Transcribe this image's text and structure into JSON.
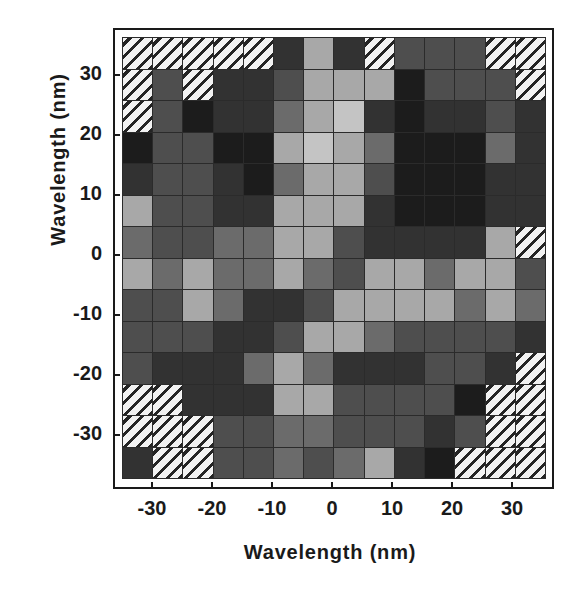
{
  "chart_data": {
    "type": "heatmap",
    "title": "",
    "xlabel": "Wavelength (nm)",
    "ylabel": "Wavelength (nm)",
    "xlim": [
      -35,
      35
    ],
    "ylim": [
      -35,
      35
    ],
    "cell_size_nm": 5,
    "grid": true,
    "legend": "none",
    "n_cols": 14,
    "n_rows": 14,
    "xticks": [
      "-30",
      "-20",
      "-10",
      "0",
      "10",
      "20",
      "30"
    ],
    "yticks": [
      "30",
      "20",
      "10",
      "0",
      "-10",
      "-20",
      "-30"
    ],
    "xtick_values": [
      -30,
      -20,
      -10,
      0,
      10,
      20,
      30
    ],
    "ytick_values": [
      30,
      20,
      10,
      0,
      -10,
      -20,
      -30
    ],
    "x_centers": [
      -32.5,
      -27.5,
      -22.5,
      -17.5,
      -12.5,
      -7.5,
      -2.5,
      2.5,
      7.5,
      12.5,
      17.5,
      22.5,
      27.5,
      32.5
    ],
    "y_centers": [
      32.5,
      27.5,
      22.5,
      17.5,
      12.5,
      7.5,
      2.5,
      -2.5,
      -7.5,
      -12.5,
      -17.5,
      -22.5,
      -27.5,
      -32.5
    ],
    "levels": {
      "hatch": "no data / masked",
      "1": "#1c1c1c",
      "2": "#323232",
      "3": "#4e4e4e",
      "4": "#6b6b6b",
      "5": "#a8a8a8",
      "6": "#c4c4c4"
    },
    "values": [
      [
        "hatch",
        "hatch",
        "hatch",
        "hatch",
        "hatch",
        "2",
        "5",
        "2",
        "hatch",
        "3",
        "3",
        "3",
        "hatch",
        "hatch"
      ],
      [
        "hatch",
        "3",
        "hatch",
        "2",
        "2",
        "3",
        "5",
        "5",
        "5",
        "1",
        "3",
        "3",
        "3",
        "hatch"
      ],
      [
        "hatch",
        "3",
        "1",
        "2",
        "2",
        "4",
        "5",
        "6",
        "2",
        "1",
        "2",
        "2",
        "3",
        "2"
      ],
      [
        "1",
        "3",
        "3",
        "1",
        "1",
        "5",
        "6",
        "5",
        "4",
        "1",
        "1",
        "1",
        "4",
        "2"
      ],
      [
        "2",
        "3",
        "3",
        "2",
        "1",
        "4",
        "5",
        "5",
        "3",
        "1",
        "1",
        "1",
        "2",
        "2"
      ],
      [
        "5",
        "3",
        "3",
        "2",
        "2",
        "5",
        "5",
        "5",
        "2",
        "1",
        "1",
        "1",
        "2",
        "2"
      ],
      [
        "4",
        "3",
        "3",
        "4",
        "4",
        "5",
        "5",
        "3",
        "2",
        "2",
        "2",
        "2",
        "5",
        "hatch"
      ],
      [
        "5",
        "4",
        "5",
        "4",
        "4",
        "5",
        "4",
        "3",
        "5",
        "5",
        "4",
        "5",
        "5",
        "3"
      ],
      [
        "3",
        "3",
        "5",
        "4",
        "2",
        "2",
        "3",
        "5",
        "5",
        "5",
        "5",
        "4",
        "5",
        "4"
      ],
      [
        "3",
        "3",
        "3",
        "2",
        "2",
        "3",
        "5",
        "5",
        "4",
        "3",
        "3",
        "3",
        "3",
        "2"
      ],
      [
        "3",
        "2",
        "2",
        "2",
        "4",
        "5",
        "4",
        "2",
        "2",
        "2",
        "3",
        "3",
        "2",
        "hatch"
      ],
      [
        "hatch",
        "hatch",
        "2",
        "2",
        "2",
        "5",
        "5",
        "3",
        "3",
        "3",
        "3",
        "1",
        "hatch",
        "hatch"
      ],
      [
        "hatch",
        "hatch",
        "hatch",
        "3",
        "3",
        "4",
        "4",
        "3",
        "3",
        "3",
        "2",
        "3",
        "hatch",
        "hatch"
      ],
      [
        "2",
        "hatch",
        "hatch",
        "3",
        "3",
        "4",
        "3",
        "4",
        "5",
        "2",
        "1",
        "hatch",
        "hatch",
        "hatch"
      ]
    ]
  },
  "axes": {
    "x": {
      "title": "Wavelength (nm)",
      "ticks": [
        {
          "label": "-30",
          "px": 152
        },
        {
          "label": "-20",
          "px": 212
        },
        {
          "label": "-10",
          "px": 272
        },
        {
          "label": "0",
          "px": 332
        },
        {
          "label": "10",
          "px": 392
        },
        {
          "label": "20",
          "px": 452
        },
        {
          "label": "30",
          "px": 512
        }
      ]
    },
    "y": {
      "title": "Wavelength (nm)",
      "ticks": [
        {
          "label": "30",
          "px": 75
        },
        {
          "label": "20",
          "px": 135
        },
        {
          "label": "10",
          "px": 195
        },
        {
          "label": "0",
          "px": 255
        },
        {
          "label": "-10",
          "px": 315
        },
        {
          "label": "-20",
          "px": 375
        },
        {
          "label": "-30",
          "px": 435
        }
      ]
    }
  }
}
